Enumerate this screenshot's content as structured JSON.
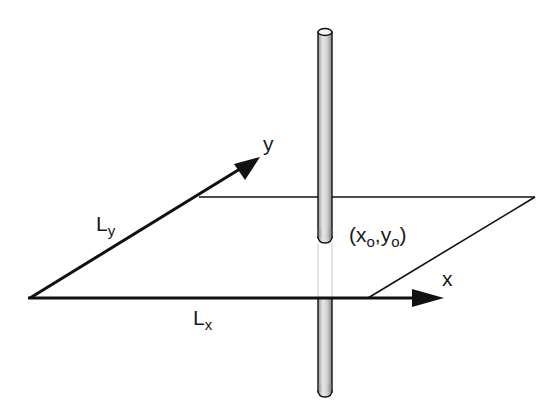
{
  "diagram": {
    "type": "3D coordinate plane with vertical rod piercing a rectangular plate",
    "colors": {
      "line": "#111111",
      "rod_fill": "#d9d9d9",
      "rod_hidden": "#c8c8c8",
      "background": "#ffffff"
    },
    "plane": {
      "corners": [
        [
          30,
          298
        ],
        [
          199,
          197
        ],
        [
          535,
          197
        ],
        [
          368,
          298
        ]
      ]
    },
    "axes": {
      "x": {
        "label": "x",
        "from": [
          30,
          298
        ],
        "to": [
          443,
          298
        ]
      },
      "y": {
        "label": "y",
        "from": [
          30,
          298
        ],
        "to": [
          258,
          158
        ]
      }
    },
    "rod": {
      "center_x": 325,
      "top_y": 28,
      "bottom_y": 397,
      "width": 14,
      "hidden_from_y": 240,
      "hidden_to_y": 298
    },
    "labels": {
      "ly": {
        "main": "L",
        "sub": "y"
      },
      "lx": {
        "main": "L",
        "sub": "x"
      },
      "point": {
        "open": "(x",
        "sub1": "o",
        "mid": ",y",
        "sub2": "o",
        "close": ")"
      },
      "x_axis": "x",
      "y_axis": "y"
    }
  }
}
